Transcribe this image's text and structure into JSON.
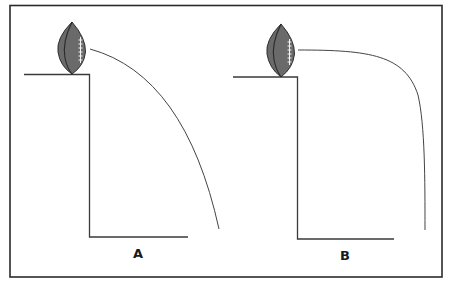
{
  "figure": {
    "colors": {
      "frame": "#2b2b2b",
      "line": "#333333",
      "ball_fill": "#6a6a6a",
      "ball_outline": "#2e2e2e",
      "laces": "#f2f2f2",
      "background": "#ffffff"
    },
    "panels": [
      {
        "label": "A",
        "trajectory": "parabolic arc falling to the right"
      },
      {
        "label": "B",
        "trajectory": "horizontal then sharp downward turn"
      }
    ]
  }
}
